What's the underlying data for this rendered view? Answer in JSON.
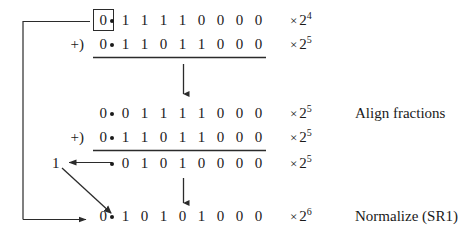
{
  "figure": {
    "ink_color": "#1a1a1a",
    "line_color": "#2b2b2b",
    "radix_point": "•",
    "times_symbol": "×"
  },
  "rows": [
    {
      "id": "operand-1",
      "op_label": "",
      "lead_digit": "0",
      "fraction": [
        "1",
        "1",
        "1",
        "1",
        "0",
        "0",
        "0",
        "0"
      ],
      "exponent_base": "2",
      "exponent_power": "4",
      "note": ""
    },
    {
      "id": "operand-2",
      "op_label": "+)",
      "lead_digit": "0",
      "fraction": [
        "1",
        "1",
        "0",
        "1",
        "1",
        "0",
        "0",
        "0"
      ],
      "exponent_base": "2",
      "exponent_power": "5",
      "note": ""
    },
    {
      "id": "aligned-operand-1",
      "op_label": "",
      "lead_digit": "0",
      "fraction": [
        "0",
        "1",
        "1",
        "1",
        "1",
        "0",
        "0",
        "0"
      ],
      "exponent_base": "2",
      "exponent_power": "5",
      "note": "Align fractions"
    },
    {
      "id": "aligned-operand-2",
      "op_label": "+)",
      "lead_digit": "0",
      "fraction": [
        "1",
        "1",
        "0",
        "1",
        "1",
        "0",
        "0",
        "0"
      ],
      "exponent_base": "2",
      "exponent_power": "5",
      "note": ""
    },
    {
      "id": "sum-with-carry",
      "op_label": "",
      "lead_digit": "",
      "fraction": [
        "0",
        "1",
        "0",
        "1",
        "0",
        "0",
        "0",
        "0"
      ],
      "exponent_base": "2",
      "exponent_power": "5",
      "note": "",
      "carry_digit": "1"
    },
    {
      "id": "normalized-result",
      "op_label": "",
      "lead_digit": "0",
      "fraction": [
        "1",
        "0",
        "1",
        "0",
        "1",
        "0",
        "0",
        "0"
      ],
      "exponent_base": "2",
      "exponent_power": "6",
      "note": "Normalize (SR1)"
    }
  ]
}
